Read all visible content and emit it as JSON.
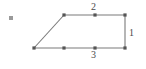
{
  "figure": {
    "name": "trapezoid-with-edge-counts",
    "background_color": "#ffffff",
    "stroke_color": "#7a7a7a",
    "vertex_marker_color": "#555555",
    "label_color": "#4a4a4a",
    "canvas": {
      "width": 146,
      "height": 69
    },
    "bullet_marker": {
      "name": "bullet-dot",
      "x": 11,
      "y": 18,
      "size": 4,
      "color": "#9a9a9a"
    },
    "vertices": [
      {
        "name": "bottom-left",
        "x": 34,
        "y": 48
      },
      {
        "name": "top-left",
        "x": 64,
        "y": 15
      },
      {
        "name": "top-right",
        "x": 125,
        "y": 15
      },
      {
        "name": "bottom-right",
        "x": 125,
        "y": 48
      }
    ],
    "tick_points": [
      {
        "name": "top-edge-midpoint",
        "x": 95,
        "y": 15
      },
      {
        "name": "bottom-edge-third-1",
        "x": 64,
        "y": 48
      },
      {
        "name": "bottom-edge-third-2",
        "x": 95,
        "y": 48
      }
    ],
    "labels": {
      "top": "2",
      "right": "1",
      "bottom": "3"
    },
    "edge_segment_counts": {
      "top": 2,
      "right": 1,
      "bottom": 3,
      "slant": 1
    }
  }
}
